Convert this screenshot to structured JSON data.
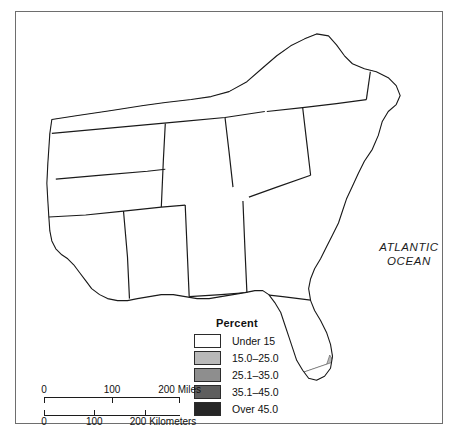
{
  "figure": {
    "type": "choropleth-map",
    "region": "Southeastern United States",
    "unit": "county"
  },
  "ocean": {
    "line1": "ATLANTIC",
    "line2": "OCEAN"
  },
  "legend": {
    "title": "Percent",
    "entries": [
      {
        "label": "Under 15",
        "color": "#ffffff"
      },
      {
        "label": "15.0–25.0",
        "color": "#b9b9b9"
      },
      {
        "label": "25.1–35.0",
        "color": "#8e8e8e"
      },
      {
        "label": "35.1–45.0",
        "color": "#5e5e5e"
      },
      {
        "label": "Over 45.0",
        "color": "#262626"
      }
    ]
  },
  "scale": {
    "miles": {
      "unit_label": "200 Miles",
      "ticks": [
        "0",
        "100",
        "200"
      ]
    },
    "kilometers": {
      "unit_label": "200 Kilometers",
      "ticks": [
        "0",
        "100",
        "200"
      ]
    }
  },
  "colors": {
    "frame": "#6e6e6e",
    "county_outline": "#3a3a3a",
    "state_outline": "#1a1a1a",
    "coastline": "#1a1a1a",
    "background": "#ffffff"
  },
  "chart_data": {
    "type": "heatmap",
    "title": "",
    "legend_position": "bottom-center",
    "classes": [
      {
        "label": "Under 15",
        "min": null,
        "max": 15,
        "color": "#ffffff"
      },
      {
        "label": "15.0–25.0",
        "min": 15,
        "max": 25,
        "color": "#b9b9b9"
      },
      {
        "label": "25.1–35.0",
        "min": 25.1,
        "max": 35,
        "color": "#8e8e8e"
      },
      {
        "label": "35.1–45.0",
        "min": 35.1,
        "max": 45,
        "color": "#5e5e5e"
      },
      {
        "label": "Over 45.0",
        "min": 45,
        "max": null,
        "color": "#262626"
      }
    ]
  }
}
